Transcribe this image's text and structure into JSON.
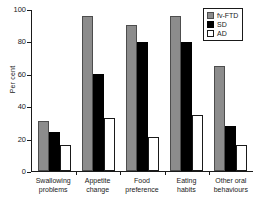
{
  "chart_data": {
    "type": "bar",
    "title": "",
    "xlabel": "",
    "ylabel": "Per cent",
    "ylim": [
      0,
      100
    ],
    "yticks": [
      0,
      20,
      40,
      60,
      80,
      100
    ],
    "grid": false,
    "legend_position": "top-right",
    "categories": [
      "Swallowing problems",
      "Appetite change",
      "Food preference",
      "Eating habits",
      "Other oral behaviours"
    ],
    "category_lines": [
      [
        "Swallowing",
        "problems"
      ],
      [
        "Appetite",
        "change"
      ],
      [
        "Food",
        "preference"
      ],
      [
        "Eating",
        "habits"
      ],
      [
        "Other oral",
        "behaviours"
      ]
    ],
    "series": [
      {
        "name": "fv-FTD",
        "color": "#8c8c8c",
        "values": [
          31,
          96,
          91,
          96,
          65
        ]
      },
      {
        "name": "SD",
        "color": "#000000",
        "values": [
          24,
          60,
          80,
          80,
          28
        ]
      },
      {
        "name": "AD",
        "color": "#ffffff",
        "values": [
          16,
          33,
          21,
          35,
          16
        ]
      }
    ]
  },
  "axis": {
    "y_title": "Per cent",
    "tick_0": "0",
    "tick_20": "20",
    "tick_40": "40",
    "tick_60": "60",
    "tick_80": "80",
    "tick_100": "100"
  },
  "legend": {
    "items": [
      {
        "label": "fv-FTD"
      },
      {
        "label": "SD"
      },
      {
        "label": "AD"
      }
    ]
  }
}
